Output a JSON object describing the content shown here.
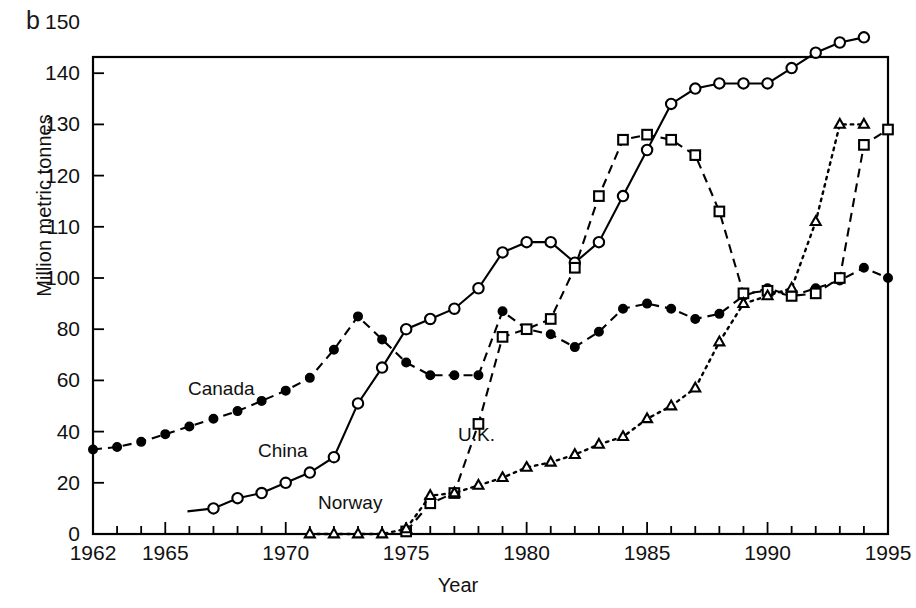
{
  "panel": {
    "letter": "b"
  },
  "axes": {
    "xlabel": "Year",
    "ylabel": "Million metric tonnes",
    "xticks": [
      1962,
      1963,
      1964,
      1965,
      1966,
      1967,
      1968,
      1969,
      1970,
      1971,
      1972,
      1973,
      1974,
      1975,
      1976,
      1977,
      1978,
      1979,
      1980,
      1981,
      1982,
      1983,
      1984,
      1985,
      1986,
      1987,
      1988,
      1989,
      1990,
      1991,
      1992,
      1993,
      1994,
      1995
    ],
    "xtick_labels": [
      {
        "value": 1962,
        "text": "1962"
      },
      {
        "value": 1965,
        "text": "1965"
      },
      {
        "value": 1970,
        "text": "1970"
      },
      {
        "value": 1975,
        "text": "1975"
      },
      {
        "value": 1980,
        "text": "1980"
      },
      {
        "value": 1985,
        "text": "1985"
      },
      {
        "value": 1990,
        "text": "1990"
      },
      {
        "value": 1995,
        "text": "1995"
      }
    ],
    "ytick_labels": [
      {
        "value": 150,
        "text": "150"
      },
      {
        "value": 140,
        "text": "140"
      },
      {
        "value": 130,
        "text": "130"
      },
      {
        "value": 120,
        "text": "120"
      },
      {
        "value": 110,
        "text": "110"
      },
      {
        "value": 100,
        "text": "100"
      },
      {
        "value": 80,
        "text": "80"
      },
      {
        "value": 60,
        "text": "60"
      },
      {
        "value": 40,
        "text": "40"
      },
      {
        "value": 20,
        "text": "20"
      },
      {
        "value": 0,
        "text": "0"
      }
    ],
    "xlim": [
      1962,
      1995
    ],
    "ylim": [
      0,
      150
    ],
    "grid": false
  },
  "series_labels": [
    {
      "name": "canada-label",
      "text": "Canada",
      "x": 188,
      "y": 378
    },
    {
      "name": "china-label",
      "text": "China",
      "x": 258,
      "y": 440
    },
    {
      "name": "uk-label",
      "text": "U.K.",
      "x": 458,
      "y": 424
    },
    {
      "name": "norway-label",
      "text": "Norway",
      "x": 318,
      "y": 492
    }
  ],
  "chart_data": {
    "type": "line",
    "title": "",
    "xlabel": "Year",
    "ylabel": "Million metric tonnes",
    "xlim": [
      1962,
      1995
    ],
    "ylim": [
      0,
      150
    ],
    "grid": false,
    "legend_position": "inline-annotations",
    "yscale_note": "piecewise: 0-100 compressed (20 units per tick), 100-150 expanded (10 units per tick)",
    "series": [
      {
        "name": "Canada",
        "marker": "filled-circle",
        "line": "dashed",
        "x": [
          1962,
          1963,
          1964,
          1965,
          1966,
          1967,
          1968,
          1969,
          1970,
          1971,
          1972,
          1973,
          1974,
          1975,
          1976,
          1977,
          1978,
          1979,
          1980,
          1981,
          1982,
          1983,
          1984,
          1985,
          1986,
          1987,
          1988,
          1989,
          1990,
          1991,
          1992,
          1993,
          1994,
          1995
        ],
        "values": [
          33,
          34,
          36,
          39,
          42,
          45,
          48,
          52,
          56,
          61,
          72,
          85,
          76,
          67,
          62,
          62,
          62,
          87,
          80,
          78,
          73,
          79,
          88,
          90,
          88,
          84,
          86,
          93,
          96,
          93,
          96,
          99,
          102,
          100
        ]
      },
      {
        "name": "China",
        "marker": "open-circle",
        "line": "solid",
        "x": [
          1967,
          1968,
          1969,
          1970,
          1971,
          1972,
          1973,
          1974,
          1975,
          1976,
          1977,
          1978,
          1979,
          1980,
          1981,
          1982,
          1983,
          1984,
          1985,
          1986,
          1987,
          1988,
          1989,
          1990,
          1991,
          1992,
          1993,
          1994
        ],
        "values": [
          10,
          14,
          16,
          20,
          24,
          30,
          51,
          65,
          80,
          84,
          88,
          96,
          105,
          107,
          107,
          103,
          107,
          116,
          125,
          134,
          137,
          138,
          138,
          138,
          141,
          144,
          146,
          147
        ]
      },
      {
        "name": "U.K.",
        "marker": "open-square",
        "line": "dashed",
        "x": [
          1975,
          1976,
          1977,
          1978,
          1979,
          1980,
          1981,
          1982,
          1983,
          1984,
          1985,
          1986,
          1987,
          1988,
          1989,
          1990,
          1991,
          1992,
          1993,
          1994,
          1995
        ],
        "values": [
          1,
          12,
          16,
          43,
          77,
          80,
          84,
          102,
          116,
          127,
          128,
          127,
          124,
          113,
          94,
          95,
          93,
          94,
          100,
          126,
          129
        ]
      },
      {
        "name": "Norway",
        "marker": "open-triangle",
        "line": "dotted",
        "x": [
          1971,
          1972,
          1973,
          1974,
          1975,
          1976,
          1977,
          1978,
          1979,
          1980,
          1981,
          1982,
          1983,
          1984,
          1985,
          1986,
          1987,
          1988,
          1989,
          1990,
          1991,
          1992,
          1993,
          1994
        ],
        "values": [
          0,
          0,
          0,
          0,
          2,
          15,
          16,
          19,
          22,
          26,
          28,
          31,
          35,
          38,
          45,
          50,
          57,
          75,
          90,
          93,
          96,
          111,
          130,
          130
        ]
      }
    ]
  }
}
